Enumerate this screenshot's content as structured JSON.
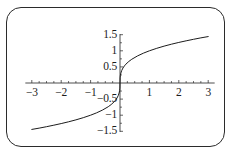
{
  "figure": {
    "frame_border_color": "#2b2b2b",
    "background_color": "#ffffff",
    "curve_color": "#1c1c1c",
    "axis_color": "#3a3a3a"
  },
  "chart_data": {
    "type": "line",
    "title": "",
    "subtitle": "",
    "xlabel": "",
    "ylabel": "",
    "xlim": [
      -3.3,
      3.3
    ],
    "ylim": [
      -1.55,
      1.55
    ],
    "grid": false,
    "legend": null,
    "x_tick_labels": [
      "-3",
      "-2",
      "-1",
      "1",
      "2",
      "3"
    ],
    "x_tick_values": [
      -3,
      -2,
      -1,
      1,
      2,
      3
    ],
    "y_tick_labels": [
      "1.5",
      "1",
      "0.5",
      "-0.5",
      "-1",
      "-1.5"
    ],
    "y_tick_values": [
      1.5,
      1,
      0.5,
      -0.5,
      -1,
      -1.5
    ],
    "minor_tick_step": 0.25,
    "series": [
      {
        "name": "cube root curve",
        "expression": "y = sign(x) * |x|^(1/3)",
        "x": [
          -3.0,
          -2.75,
          -2.5,
          -2.25,
          -2.0,
          -1.75,
          -1.5,
          -1.25,
          -1.0,
          -0.8,
          -0.6,
          -0.4,
          -0.3,
          -0.2,
          -0.15,
          -0.1,
          -0.06,
          -0.03,
          -0.012,
          -0.004,
          0.0,
          0.004,
          0.012,
          0.03,
          0.06,
          0.1,
          0.15,
          0.2,
          0.3,
          0.4,
          0.6,
          0.8,
          1.0,
          1.25,
          1.5,
          1.75,
          2.0,
          2.25,
          2.5,
          2.75,
          3.0
        ],
        "y": [
          -1.442,
          -1.402,
          -1.357,
          -1.31,
          -1.26,
          -1.205,
          -1.145,
          -1.077,
          -1.0,
          -0.928,
          -0.843,
          -0.737,
          -0.669,
          -0.585,
          -0.531,
          -0.464,
          -0.391,
          -0.311,
          -0.229,
          -0.159,
          0.0,
          0.159,
          0.229,
          0.311,
          0.391,
          0.464,
          0.531,
          0.585,
          0.669,
          0.737,
          0.843,
          0.928,
          1.0,
          1.077,
          1.145,
          1.205,
          1.26,
          1.31,
          1.357,
          1.402,
          1.442
        ]
      }
    ]
  }
}
